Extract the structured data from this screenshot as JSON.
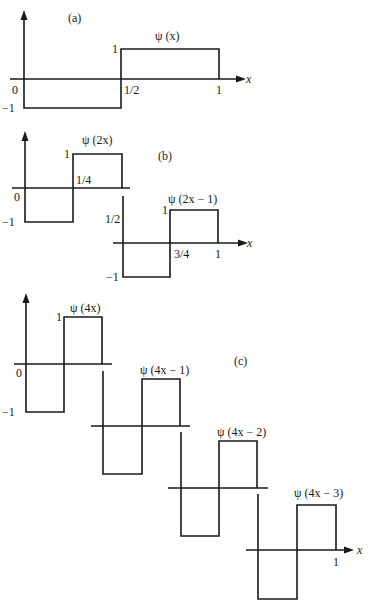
{
  "figure": {
    "panels": [
      {
        "id": "a",
        "label": "(a)",
        "label_pos": [
          68,
          22
        ],
        "functions": [
          {
            "title": "ψ (x)",
            "title_pos": [
              155,
              40
            ],
            "axis_y": 79,
            "x0": 24,
            "xmid": 121,
            "x1": 219,
            "y_hi": 49,
            "y_lo": 108,
            "axis_from": 10,
            "axis_to": 238,
            "arrow": true,
            "x_axis_label": "x",
            "x_axis_label_pos": [
              246,
              83
            ],
            "yaxis": {
              "x": 24,
              "top": 10
            },
            "labels": [
              {
                "text": "0",
                "x": 12,
                "y": 94
              },
              {
                "text": "−1",
                "x": 2,
                "y": 112
              },
              {
                "text": "1",
                "x": 112,
                "y": 53
              },
              {
                "text": "1/2",
                "x": 124,
                "y": 94
              },
              {
                "text": "1",
                "x": 216,
                "y": 94
              }
            ]
          }
        ]
      },
      {
        "id": "b",
        "label": "(b)",
        "label_pos": [
          158,
          160
        ],
        "functions": [
          {
            "title": "ψ (2x)",
            "title_pos": [
              82,
              144
            ],
            "axis_y": 188,
            "x0": 25,
            "xmid": 73,
            "x1": 122,
            "y_hi": 154,
            "y_lo": 222,
            "axis_from": 12,
            "axis_to": 130,
            "arrow": false,
            "yaxis": {
              "x": 25,
              "top": 131
            },
            "labels": [
              {
                "text": "0",
                "x": 14,
                "y": 201
              },
              {
                "text": "−1",
                "x": 2,
                "y": 226
              },
              {
                "text": "1",
                "x": 64,
                "y": 158
              },
              {
                "text": "1/4",
                "x": 76,
                "y": 184
              }
            ]
          },
          {
            "title": "ψ (2x − 1)",
            "title_pos": [
              168,
              203
            ],
            "axis_y": 243,
            "x0": 123,
            "xmid": 170,
            "x1": 218,
            "y_hi": 210,
            "y_lo": 277,
            "axis_from": 113,
            "axis_to": 240,
            "arrow": true,
            "x_axis_label": "x",
            "x_axis_label_pos": [
              247,
              247
            ],
            "vline": {
              "x": 123,
              "top": 196
            },
            "labels": [
              {
                "text": "1/2",
                "x": 105,
                "y": 223
              },
              {
                "text": "−1",
                "x": 106,
                "y": 281
              },
              {
                "text": "1",
                "x": 162,
                "y": 214
              },
              {
                "text": "3/4",
                "x": 174,
                "y": 258
              },
              {
                "text": "1",
                "x": 215,
                "y": 258
              }
            ]
          }
        ]
      },
      {
        "id": "c",
        "label": "(c)",
        "label_pos": [
          234,
          365
        ],
        "functions": [
          {
            "title": "ψ (4x)",
            "title_pos": [
              70,
              312
            ],
            "axis_y": 364,
            "x0": 26,
            "xmid": 64,
            "x1": 102,
            "y_hi": 317,
            "y_lo": 412,
            "axis_from": 14,
            "axis_to": 112,
            "arrow": false,
            "yaxis": {
              "x": 26,
              "top": 293
            },
            "labels": [
              {
                "text": "0",
                "x": 16,
                "y": 377
              },
              {
                "text": "−1",
                "x": 2,
                "y": 416
              },
              {
                "text": "1",
                "x": 56,
                "y": 321
              }
            ]
          },
          {
            "title": "ψ (4x − 1)",
            "title_pos": [
              140,
              374
            ],
            "axis_y": 426,
            "x0": 103,
            "xmid": 142,
            "x1": 180,
            "y_hi": 379,
            "y_lo": 474,
            "axis_from": 91,
            "axis_to": 190,
            "arrow": false,
            "vline": {
              "x": 103,
              "top": 371
            }
          },
          {
            "title": "ψ (4x − 2)",
            "title_pos": [
              217,
              436
            ],
            "axis_y": 488,
            "x0": 181,
            "xmid": 219,
            "x1": 257,
            "y_hi": 441,
            "y_lo": 536,
            "axis_from": 168,
            "axis_to": 268,
            "arrow": false,
            "vline": {
              "x": 181,
              "top": 432
            }
          },
          {
            "title": "ψ (4x − 3)",
            "title_pos": [
              294,
              497
            ],
            "axis_y": 550,
            "x0": 258,
            "xmid": 297,
            "x1": 336,
            "y_hi": 505,
            "y_lo": 599,
            "axis_from": 246,
            "axis_to": 346,
            "arrow": true,
            "x_axis_label": "x",
            "x_axis_label_pos": [
              357,
              554
            ],
            "vline": {
              "x": 258,
              "top": 494
            },
            "labels": [
              {
                "text": "1",
                "x": 333,
                "y": 566
              }
            ]
          }
        ]
      }
    ]
  }
}
